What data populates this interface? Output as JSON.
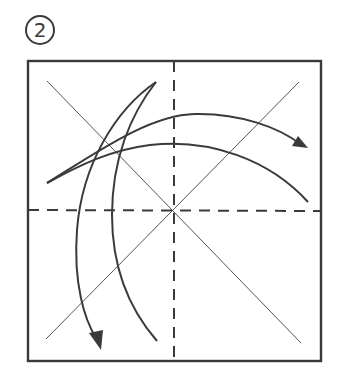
{
  "step": {
    "number": "2",
    "badge_style": "circled-number"
  },
  "diagram": {
    "square": {
      "x": 28,
      "y": 61,
      "width": 293,
      "height": 300
    },
    "creases": {
      "diagonals": "thin solid (existing creases)",
      "midlines": "dashed (valley folds)"
    },
    "arrows": [
      {
        "name": "fold-right-arrow",
        "direction": "left-to-right",
        "description": "Fold left side over to the right"
      },
      {
        "name": "fold-down-arrow",
        "direction": "top-to-bottom",
        "description": "Fold top side down to the bottom"
      }
    ],
    "colors": {
      "line": "#3a3a3a",
      "background": "#ffffff"
    }
  }
}
